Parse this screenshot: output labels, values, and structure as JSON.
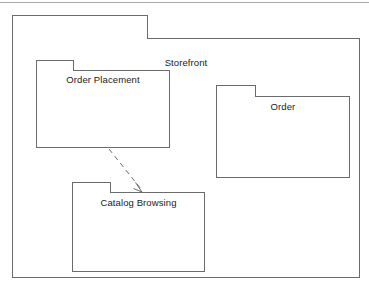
{
  "diagram": {
    "type": "uml-package-diagram",
    "title": "Storefront",
    "packages": [
      {
        "id": "storefront",
        "name": "Storefront",
        "level": 0,
        "contains": [
          "order-placement",
          "order",
          "catalog-browsing"
        ]
      },
      {
        "id": "order-placement",
        "name": "Order Placement",
        "level": 1,
        "parent": "storefront"
      },
      {
        "id": "order",
        "name": "Order",
        "level": 1,
        "parent": "storefront"
      },
      {
        "id": "catalog-browsing",
        "name": "Catalog Browsing",
        "level": 1,
        "parent": "storefront"
      }
    ],
    "relationships": [
      {
        "id": "dep-order-placement-to-catalog-browsing",
        "kind": "dependency",
        "style": "dashed-open-arrow",
        "source": "order-placement",
        "target": "catalog-browsing",
        "label": ""
      }
    ],
    "colors": {
      "stroke": "#6b6b6b",
      "fill": "#ffffff",
      "text": "#1a1a1a",
      "rule": "#a8a8a8"
    }
  }
}
